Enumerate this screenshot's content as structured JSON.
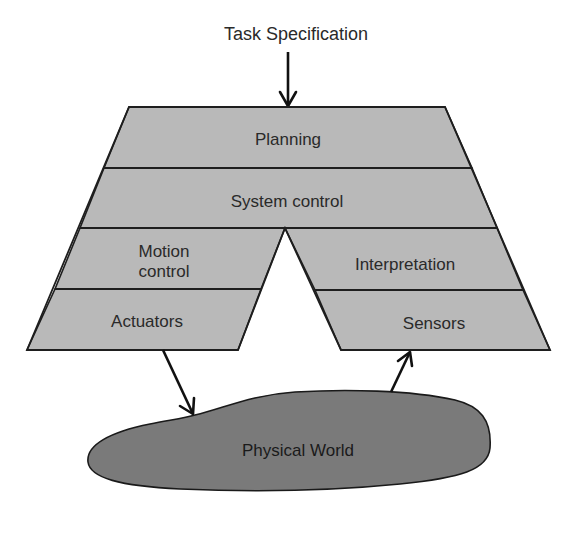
{
  "diagram": {
    "title": "Task Specification",
    "layers": {
      "planning": "Planning",
      "system_control": "System control",
      "motion_control_line1": "Motion",
      "motion_control_line2": "control",
      "actuators": "Actuators",
      "interpretation": "Interpretation",
      "sensors": "Sensors"
    },
    "environment": "Physical World",
    "colors": {
      "layer_fill": "#b9b9b9",
      "world_fill": "#7a7a7a",
      "stroke": "#1e1e1e",
      "text": "#2a2a2a"
    },
    "connections": [
      {
        "from": "Task Specification",
        "to": "Planning"
      },
      {
        "from": "Actuators",
        "to": "Physical World"
      },
      {
        "from": "Physical World",
        "to": "Sensors"
      }
    ]
  }
}
